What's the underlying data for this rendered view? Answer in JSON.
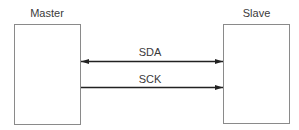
{
  "diagram": {
    "nodes": [
      {
        "id": "master",
        "label": "Master"
      },
      {
        "id": "slave",
        "label": "Slave"
      }
    ],
    "edges": [
      {
        "id": "sda",
        "label": "SDA",
        "from": "master",
        "to": "slave",
        "direction": "bidirectional"
      },
      {
        "id": "sck",
        "label": "SCK",
        "from": "master",
        "to": "slave",
        "direction": "master-to-slave"
      }
    ],
    "colors": {
      "line": "#222222",
      "box_border": "#8a8a8a",
      "text": "#3a3a3a"
    }
  }
}
